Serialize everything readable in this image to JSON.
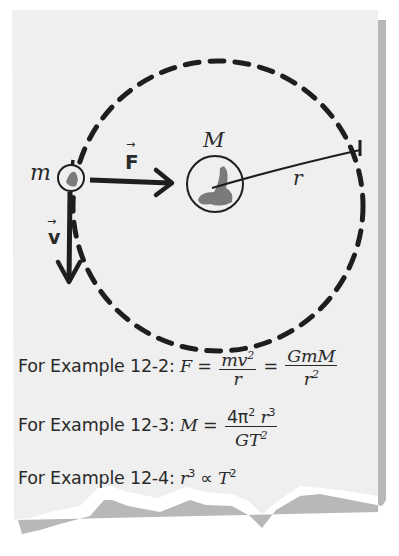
{
  "diagram": {
    "labels": {
      "small_mass": "m",
      "large_mass": "M",
      "radius": "r",
      "force": "F",
      "velocity": "v",
      "vector_arrow": "→"
    },
    "colors": {
      "background": "#ffffff",
      "paper": "#efefef",
      "paper_shadow": "#b5b5b5",
      "ink": "#1e1e1e",
      "blob": "#7a7a7a"
    }
  },
  "equations": [
    {
      "prefix": "For Example 12-2:",
      "lhs": "F",
      "eq": "=",
      "frac1_num": "mv",
      "frac1_num_sup": "2",
      "frac1_den": "r",
      "eq2": "=",
      "frac2_num": "GmM",
      "frac2_den": "r",
      "frac2_den_sup": "2"
    },
    {
      "prefix": "For Example 12-3:",
      "lhs": "M",
      "eq": "=",
      "frac_num_a": "4π",
      "frac_num_a_sup": "2",
      "frac_num_b": "r",
      "frac_num_b_sup": "3",
      "frac_den": "GT",
      "frac_den_sup": "2"
    },
    {
      "prefix": "For Example 12-4:",
      "lhs": "r",
      "lhs_sup": "3",
      "rel": "∝",
      "rhs": "T",
      "rhs_sup": "2"
    }
  ]
}
